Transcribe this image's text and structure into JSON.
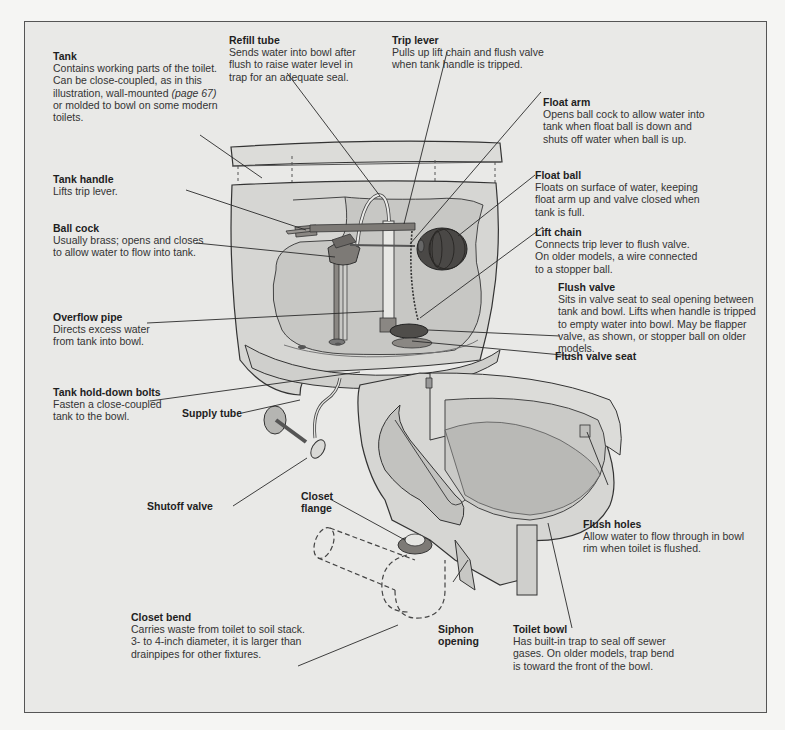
{
  "diagram": {
    "colors": {
      "background": "#f5f5f3",
      "panel": "#e9e9e7",
      "frame": "#555555",
      "porcelain": "#d9d9d6",
      "porcelain_dark": "#bdbdba",
      "water": "#b9b9b6",
      "metal": "#7d7a76",
      "float_ball": "#4a4846",
      "leader_line": "#2a2a2a"
    },
    "labels": {
      "tank": {
        "title": "Tank",
        "text_a": "Contains working parts of the toilet.\nCan be close-coupled, as in this\nillustration, wall-mounted ",
        "ref": "(page 67)",
        "text_b": "\nor molded to bowl on some modern\ntoilets."
      },
      "tank_handle": {
        "title": "Tank handle",
        "text": "Lifts trip lever."
      },
      "ball_cock": {
        "title": "Ball cock",
        "text": "Usually brass; opens and closes\nto allow water to flow into tank."
      },
      "overflow_pipe": {
        "title": "Overflow pipe",
        "text": "Directs excess water\nfrom tank into bowl."
      },
      "tank_hold_down_bolts": {
        "title": "Tank hold-down bolts",
        "text": "Fasten a close-coupled\ntank to the bowl."
      },
      "supply_tube": {
        "title": "Supply tube"
      },
      "shutoff_valve": {
        "title": "Shutoff valve"
      },
      "closet_flange": {
        "title": "Closet\nflange"
      },
      "closet_bend": {
        "title": "Closet bend",
        "text": "Carries waste from toilet to soil stack.\n3- to 4-inch diameter, it is larger than\ndrainpipes for other fixtures."
      },
      "siphon_opening": {
        "title": "Siphon\nopening"
      },
      "toilet_bowl": {
        "title": "Toilet bowl",
        "text": "Has built-in trap to seal off sewer\ngases. On older models, trap bend\nis toward the front of the bowl."
      },
      "flush_holes": {
        "title": "Flush holes",
        "text": "Allow water to flow through in bowl\nrim when toilet is flushed."
      },
      "flush_valve_seat": {
        "title": "Flush valve seat"
      },
      "flush_valve": {
        "title": "Flush valve",
        "text": "Sits in valve seat to seal opening between\ntank and bowl. Lifts when handle is tripped\nto empty water into bowl. May be flapper\nvalve, as shown, or stopper ball on older\nmodels."
      },
      "lift_chain": {
        "title": "Lift chain",
        "text": "Connects trip lever to flush valve.\nOn older models, a wire connected\nto a stopper ball."
      },
      "float_ball": {
        "title": "Float ball",
        "text": "Floats on surface of water, keeping\nfloat arm up and valve closed when\ntank is full."
      },
      "float_arm": {
        "title": "Float arm",
        "text": "Opens ball cock to allow water into\ntank when float ball is down and\nshuts off water when ball is up."
      },
      "trip_lever": {
        "title": "Trip lever",
        "text": "Pulls up lift chain and flush valve\nwhen tank handle is tripped."
      },
      "refill_tube": {
        "title": "Refill tube",
        "text": "Sends water into bowl after\nflush to raise water level in\ntrap for an adequate seal."
      }
    }
  }
}
